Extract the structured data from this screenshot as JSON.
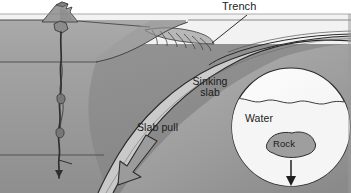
{
  "figure": {
    "type": "geological-cross-section",
    "background_color": "#ffffff"
  },
  "labels": {
    "trench": "Trench",
    "sinking_slab": "Sinking slab",
    "sinking_slab_line1": "Sinking",
    "sinking_slab_line2": "slab",
    "slab_pull": "Slab pull",
    "water": "Water",
    "rock": "Rock"
  },
  "colors": {
    "ocean_water": "#f2f2f2",
    "upper_crust": "#a6a6a6",
    "mantle_mid": "#9a9a9a",
    "mantle_deep": "#8d8d8d",
    "slab_band": "#c9c9c9",
    "wedge": "#b4b4b4",
    "inset_fill": "#fafafa",
    "inset_water": "#f7f7f7",
    "rock_blob": "#9e9e9e",
    "arrow_fill": "#9b9b9b",
    "line_dark": "#2b2b2b",
    "text": "#1a1a1a"
  },
  "elements": {
    "volcano": "mid-ocean-ridge-volcano",
    "magma_conduit": "magma-conduit",
    "accretionary_wedge": "accretionary-wedge",
    "thrust_faults_count": 7,
    "slab_pull_arrow": "down-left-arrow",
    "inset_arrow": "downward-arrow",
    "wave_line": "water-surface-wave"
  },
  "inset": {
    "shape": "circle",
    "center_x": 291,
    "center_y": 127,
    "radius": 59,
    "analogy": "dense rock sinks through water like a cold slab sinks through the mantle"
  }
}
